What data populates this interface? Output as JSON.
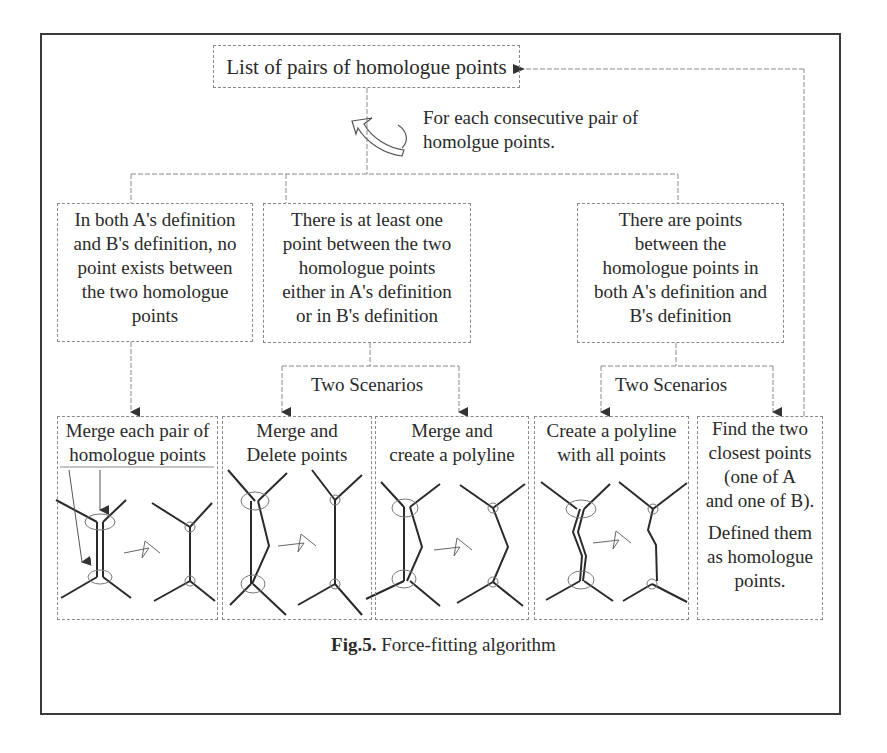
{
  "figure": {
    "caption_prefix": "Fig.5.",
    "caption_text": " Force-fitting algorithm"
  },
  "top": {
    "label": "List of pairs of homologue points",
    "loop_note_line1": "For each consecutive pair of",
    "loop_note_line2": "homolgue points."
  },
  "conditions": [
    {
      "lines": [
        "In both A's definition",
        "and B's definition, no",
        "point exists between",
        "the two homologue",
        "points"
      ]
    },
    {
      "lines": [
        "There is at least one",
        "point between the two",
        "homologue points",
        "either in A's definition",
        "or in B's definition"
      ]
    },
    {
      "lines": [
        "There are points",
        "between the",
        "homologue points in",
        "both A's definition and",
        "B's definition"
      ]
    }
  ],
  "scenario_labels": [
    "Two Scenarios",
    "Two Scenarios"
  ],
  "actions": [
    {
      "lines": [
        "Merge each pair of",
        "homologue points"
      ]
    },
    {
      "lines": [
        "Merge and",
        "Delete points"
      ]
    },
    {
      "lines": [
        "Merge and",
        "create a polyline"
      ]
    },
    {
      "lines": [
        "Create a polyline",
        "with all points"
      ]
    },
    {
      "lines": [
        "Find the two",
        "closest points",
        "(one of A",
        "and one of B).",
        "",
        "Defined them",
        "as homologue",
        "points."
      ]
    }
  ],
  "colors": {
    "line": "#3a3a3a",
    "dashed": "#8a8a8a",
    "text": "#2a2a2a"
  }
}
